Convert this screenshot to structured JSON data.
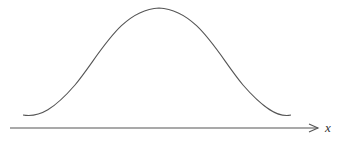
{
  "diagram": {
    "type": "bell-curve",
    "x_axis": {
      "label": "x",
      "has_arrow": true
    },
    "colors": {
      "curve": "#555555",
      "axis": "#555555",
      "label": "#333333",
      "background": "#ffffff"
    }
  }
}
